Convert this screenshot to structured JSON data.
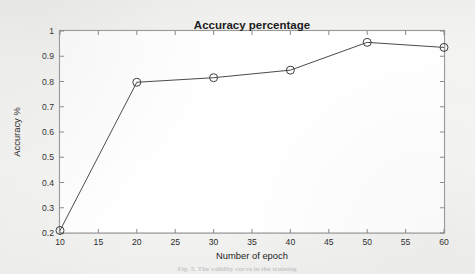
{
  "figure": {
    "caption": "Fig. 5. The validity curve in the training",
    "background_color": "#f3f3f1",
    "plot_background_color": "#ffffff",
    "axis_color": "#9a9a9a",
    "grid_color": "#e6e6e6",
    "series_color": "#4a4a4a"
  },
  "chart_data": {
    "type": "line",
    "title": "Accuracy percentage",
    "xlabel": "Number of epoch",
    "ylabel": "Accuracy %",
    "x": [
      10,
      20,
      30,
      40,
      50,
      60
    ],
    "values": [
      0.21,
      0.797,
      0.815,
      0.845,
      0.955,
      0.935
    ],
    "series": [
      {
        "name": "Accuracy",
        "values": [
          0.21,
          0.797,
          0.815,
          0.845,
          0.955,
          0.935
        ]
      }
    ],
    "xlim": [
      10,
      60
    ],
    "ylim": [
      0.2,
      1
    ],
    "xticks": [
      10,
      15,
      20,
      25,
      30,
      35,
      40,
      45,
      50,
      55,
      60
    ],
    "xtick_labels": [
      "10",
      "15",
      "20",
      "25",
      "30",
      "35",
      "40",
      "45",
      "50",
      "55",
      "60"
    ],
    "yticks": [
      0.2,
      0.3,
      0.4,
      0.5,
      0.6,
      0.7,
      0.8,
      0.9,
      1
    ],
    "ytick_labels": [
      "0.2",
      "0.3",
      "0.4",
      "0.5",
      "0.6",
      "0.7",
      "0.8",
      "0.9",
      "1"
    ],
    "grid": true,
    "legend": null,
    "marker": "circle",
    "marker_size": 4
  }
}
